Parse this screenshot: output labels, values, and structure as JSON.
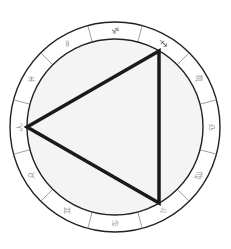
{
  "diagram": {
    "center": [
      115,
      127
    ],
    "outer_radius": 105,
    "inner_radius": 88,
    "rotation_deg": 90,
    "colors": {
      "ring_stroke": "#222222",
      "divider_stroke": "#888888",
      "glyph": "#999999",
      "glyph_dark": "#444444",
      "inner_fill": "#f4f4f4",
      "triangle_stroke": "#1a1a1a"
    },
    "signs": [
      {
        "name": "aries",
        "glyph": "♈",
        "angle": 180
      },
      {
        "name": "taurus",
        "glyph": "♉",
        "angle": 210
      },
      {
        "name": "gemini",
        "glyph": "♊",
        "angle": 240
      },
      {
        "name": "cancer",
        "glyph": "♋",
        "angle": 270
      },
      {
        "name": "leo",
        "glyph": "♌",
        "angle": 300
      },
      {
        "name": "virgo",
        "glyph": "♍",
        "angle": 330
      },
      {
        "name": "libra",
        "glyph": "♎",
        "angle": 0
      },
      {
        "name": "scorpio",
        "glyph": "♏",
        "angle": 30
      },
      {
        "name": "sagittarius",
        "glyph": "♐",
        "angle": 60
      },
      {
        "name": "capricorn",
        "glyph": "♑",
        "angle": 90
      },
      {
        "name": "aquarius",
        "glyph": "♒",
        "angle": 120
      },
      {
        "name": "pisces",
        "glyph": "♓",
        "angle": 150
      }
    ],
    "triangle": {
      "label": "fire trine",
      "vertices": [
        [
          27,
          127
        ],
        [
          159,
          51
        ],
        [
          159,
          203
        ]
      ],
      "stroke_width": 3.5
    }
  }
}
